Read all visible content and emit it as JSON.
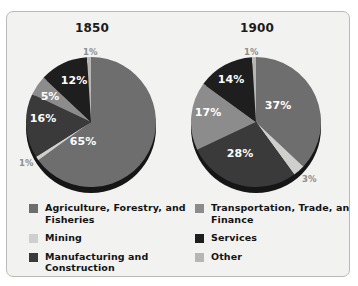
{
  "figure": {
    "background_color": "#f2f2f0",
    "border_color": "#b9b9b6"
  },
  "chart_data": [
    {
      "type": "pie",
      "title": "1850",
      "categories": [
        "Agriculture, Forestry, and Fisheries",
        "Mining",
        "Manufacturing and Construction",
        "Transportation, Trade, and Finance",
        "Services",
        "Other"
      ],
      "values": [
        65,
        1,
        16,
        5,
        12,
        1
      ],
      "labels": [
        "65%",
        "1%",
        "16%",
        "5%",
        "12%",
        "1%"
      ],
      "colors": [
        "#6e6e6e",
        "#cfcfcd",
        "#3a3a3a",
        "#8c8c8c",
        "#1e1e1e",
        "#b6b6b4"
      ],
      "label_colors": [
        "#ffffff",
        "#8d8d8a",
        "#ffffff",
        "#ffffff",
        "#ffffff",
        "#8d8d8a"
      ],
      "legend_position": "bottom"
    },
    {
      "type": "pie",
      "title": "1900",
      "categories": [
        "Agriculture, Forestry, and Fisheries",
        "Mining",
        "Manufacturing and Construction",
        "Transportation, Trade, and Finance",
        "Services",
        "Other"
      ],
      "values": [
        37,
        3,
        28,
        17,
        14,
        1
      ],
      "labels": [
        "37%",
        "3%",
        "28%",
        "17%",
        "14%",
        "1%"
      ],
      "colors": [
        "#6e6e6e",
        "#cfcfcd",
        "#3a3a3a",
        "#8c8c8c",
        "#1e1e1e",
        "#b6b6b4"
      ],
      "label_colors": [
        "#ffffff",
        "#8d8d8a",
        "#ffffff",
        "#ffffff",
        "#ffffff",
        "#8d8d8a"
      ],
      "legend_position": "bottom"
    }
  ],
  "pies": {
    "left": {
      "title": "1850",
      "slices": [
        {
          "name": "agriculture",
          "pct": 65,
          "label": "65%",
          "color": "#6e6e6e",
          "label_color": "#ffffff",
          "inside": true,
          "lx": 62,
          "ly": 92
        },
        {
          "name": "mining",
          "pct": 1,
          "label": "1%",
          "color": "#cfcfcd",
          "label_color": "#8d8d8a",
          "inside": false,
          "lx": -2,
          "ly": 108
        },
        {
          "name": "manufacturing",
          "pct": 16,
          "label": "16%",
          "color": "#3a3a3a",
          "label_color": "#ffffff",
          "inside": true,
          "lx": 22,
          "ly": 69
        },
        {
          "name": "transportation",
          "pct": 5,
          "label": "5%",
          "color": "#8c8c8c",
          "label_color": "#ffffff",
          "inside": true,
          "lx": 29,
          "ly": 47
        },
        {
          "name": "services",
          "pct": 12,
          "label": "12%",
          "color": "#1e1e1e",
          "label_color": "#ffffff",
          "inside": true,
          "lx": 53,
          "ly": 31
        },
        {
          "name": "other",
          "pct": 1,
          "label": "1%",
          "color": "#b6b6b4",
          "label_color": "#8d8d8a",
          "inside": false,
          "lx": 62,
          "ly": -3
        }
      ]
    },
    "right": {
      "title": "1900",
      "slices": [
        {
          "name": "agriculture",
          "pct": 37,
          "label": "37%",
          "color": "#6e6e6e",
          "label_color": "#ffffff",
          "inside": true,
          "lx": 92,
          "ly": 56
        },
        {
          "name": "mining",
          "pct": 3,
          "label": "3%",
          "color": "#cfcfcd",
          "label_color": "#8d8d8a",
          "inside": false,
          "lx": 116,
          "ly": 124
        },
        {
          "name": "manufacturing",
          "pct": 28,
          "label": "28%",
          "color": "#3a3a3a",
          "label_color": "#ffffff",
          "inside": true,
          "lx": 54,
          "ly": 104
        },
        {
          "name": "transportation",
          "pct": 17,
          "label": "17%",
          "color": "#8c8c8c",
          "label_color": "#ffffff",
          "inside": true,
          "lx": 22,
          "ly": 63
        },
        {
          "name": "services",
          "pct": 14,
          "label": "14%",
          "color": "#1e1e1e",
          "label_color": "#ffffff",
          "inside": true,
          "lx": 45,
          "ly": 30
        },
        {
          "name": "other",
          "pct": 1,
          "label": "1%",
          "color": "#b6b6b4",
          "label_color": "#8d8d8a",
          "inside": false,
          "lx": 58,
          "ly": -3
        }
      ]
    }
  },
  "legend": {
    "left": [
      {
        "label": "Agriculture, Forestry, and Fisheries",
        "color": "#6e6e6e"
      },
      {
        "label": "Mining",
        "color": "#cfcfcd"
      },
      {
        "label": "Manufacturing and Construction",
        "color": "#3a3a3a"
      }
    ],
    "right": [
      {
        "label": "Transportation, Trade, and Finance",
        "color": "#8c8c8c"
      },
      {
        "label": "Services",
        "color": "#1e1e1e"
      },
      {
        "label": "Other",
        "color": "#b6b6b4"
      }
    ]
  }
}
